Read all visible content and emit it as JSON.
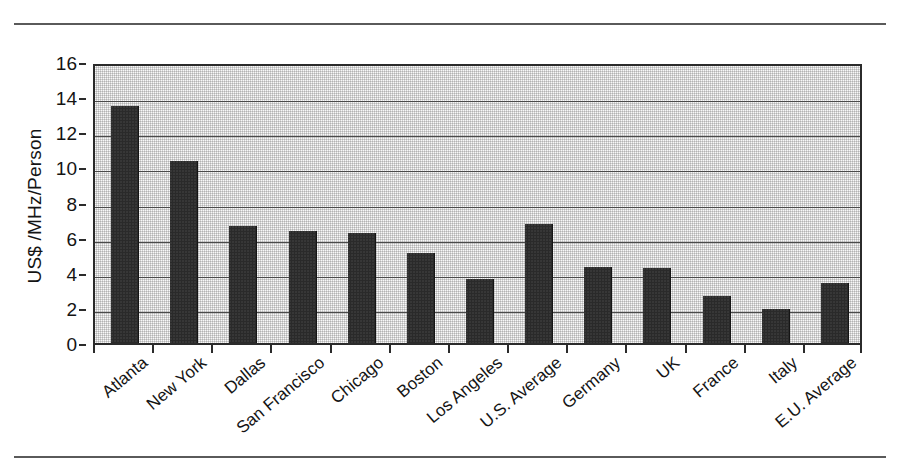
{
  "figure": {
    "y_axis_title": "US$ /MHz/Person",
    "has_top_rule": true,
    "has_bottom_rule": true
  },
  "chart_data": {
    "type": "bar",
    "title": "",
    "xlabel": "",
    "ylabel": "US$ /MHz/Person",
    "ylim": [
      0,
      16
    ],
    "ytick_step": 2,
    "yticks": [
      "16",
      "14",
      "12",
      "10",
      "8",
      "6",
      "4",
      "2",
      "0"
    ],
    "grid": true,
    "legend": null,
    "bar_color": "#2a2a2a",
    "plot_background": "#d2d2d2",
    "categories": [
      "Atlanta",
      "New York",
      "Dallas",
      "San Francisco",
      "Chicago",
      "Boston",
      "Los Angeles",
      "U.S. Average",
      "Germany",
      "UK",
      "France",
      "Italy",
      "E.U. Average"
    ],
    "values": [
      13.5,
      10.35,
      6.65,
      6.4,
      6.25,
      5.1,
      3.65,
      6.8,
      4.35,
      4.25,
      2.65,
      1.95,
      3.4
    ]
  }
}
